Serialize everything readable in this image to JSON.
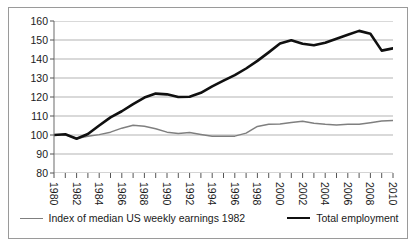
{
  "chart_data": {
    "type": "line",
    "title": "",
    "xlabel": "",
    "ylabel": "",
    "xlim": [
      1980,
      2010
    ],
    "ylim": [
      80,
      160
    ],
    "yticks": [
      80,
      90,
      100,
      110,
      120,
      130,
      140,
      150,
      160
    ],
    "xticks": [
      1980,
      1981,
      1982,
      1983,
      1984,
      1985,
      1986,
      1987,
      1988,
      1989,
      1990,
      1991,
      1992,
      1993,
      1994,
      1995,
      1996,
      1997,
      1998,
      1999,
      2000,
      2001,
      2002,
      2003,
      2004,
      2005,
      2006,
      2007,
      2008,
      2009,
      2010
    ],
    "xtick_labels": [
      "1980",
      "",
      "1982",
      "",
      "1984",
      "",
      "1986",
      "",
      "1988",
      "",
      "1990",
      "",
      "1992",
      "",
      "1994",
      "",
      "1996",
      "",
      "1998",
      "",
      "2000",
      "",
      "2002",
      "",
      "2004",
      "",
      "2006",
      "",
      "2008",
      "",
      "2010"
    ],
    "grid": "horizontal",
    "legend_position": "bottom",
    "x": [
      1980,
      1981,
      1982,
      1983,
      1984,
      1985,
      1986,
      1987,
      1988,
      1989,
      1990,
      1991,
      1992,
      1993,
      1994,
      1995,
      1996,
      1997,
      1998,
      1999,
      2000,
      2001,
      2002,
      2003,
      2004,
      2005,
      2006,
      2007,
      2008,
      2009,
      2010
    ],
    "series": [
      {
        "name": "Index of median US weekly earnings 1982",
        "color": "#7f7f7f",
        "width": 1.5,
        "values": [
          100.0,
          100.3,
          98.2,
          99.3,
          100.2,
          101.5,
          103.6,
          105.1,
          104.6,
          103.3,
          101.5,
          100.8,
          101.3,
          100.3,
          99.4,
          99.3,
          99.4,
          101.0,
          104.5,
          105.6,
          105.8,
          106.6,
          107.2,
          106.2,
          105.6,
          105.2,
          105.6,
          105.7,
          106.5,
          107.4,
          107.6
        ]
      },
      {
        "name": "Total employment",
        "color": "#101010",
        "width": 2.6,
        "values": [
          100.0,
          100.4,
          98.0,
          100.5,
          105.0,
          109.3,
          112.5,
          116.3,
          119.7,
          121.8,
          121.4,
          120.0,
          120.1,
          122.2,
          125.6,
          128.6,
          131.5,
          135.0,
          139.0,
          143.5,
          148.2,
          149.9,
          148.0,
          147.2,
          148.6,
          150.7,
          152.8,
          154.8,
          153.3,
          144.4,
          145.6
        ]
      }
    ]
  },
  "legend": {
    "items": [
      {
        "label": "Index of median US weekly earnings 1982",
        "swatch": "earnings"
      },
      {
        "label": "Total employment",
        "swatch": "employment"
      }
    ]
  }
}
